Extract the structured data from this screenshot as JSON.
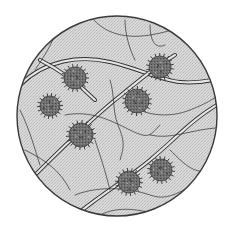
{
  "image": {
    "subject": "Microscope field of view showing pollen grains among fibers",
    "alt_text": "Circular microscope view of spiky spherical pollen grains between crossing plant fibers"
  },
  "colors": {
    "background": "#ffffff",
    "field": "#d6d6d6",
    "field_edge": "#3a3a3a",
    "fiber_stroke": "#2f2f2f",
    "fiber_fill": "#e4e4e4",
    "grain_fill": "#6f6f6f",
    "grain_dark": "#3d3d3d",
    "grain_light": "#a3a3a3"
  },
  "pollen_grains": [
    {
      "id": "grain-1",
      "label": "pollen grain"
    },
    {
      "id": "grain-2",
      "label": "pollen grain"
    },
    {
      "id": "grain-3",
      "label": "pollen grain"
    },
    {
      "id": "grain-4",
      "label": "pollen grain"
    },
    {
      "id": "grain-5",
      "label": "pollen grain"
    },
    {
      "id": "grain-6",
      "label": "pollen grain"
    },
    {
      "id": "grain-7",
      "label": "pollen grain"
    }
  ]
}
